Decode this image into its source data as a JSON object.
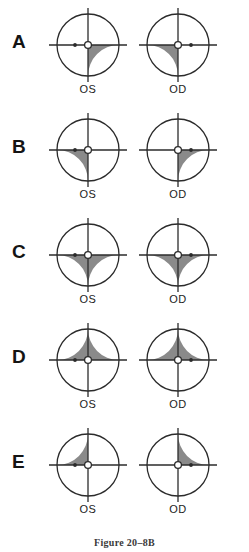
{
  "figure": {
    "caption": "Figure 20–8B",
    "colors": {
      "shaded": "#8a8a8a",
      "outline": "#2b2b2b",
      "background": "#ffffff",
      "label": "#141414"
    },
    "eye_labels": {
      "left": "OS",
      "right": "OD"
    },
    "rows": [
      {
        "label": "A",
        "os": {
          "eye_label": "OS",
          "shaded": [
            "lower-right"
          ],
          "blind_spot": "left"
        },
        "od": {
          "eye_label": "OD",
          "shaded": [
            "lower-left"
          ],
          "blind_spot": "right"
        }
      },
      {
        "label": "B",
        "os": {
          "eye_label": "OS",
          "shaded": [
            "lower-left"
          ],
          "blind_spot": "left"
        },
        "od": {
          "eye_label": "OD",
          "shaded": [
            "lower-right"
          ],
          "blind_spot": "right"
        }
      },
      {
        "label": "C",
        "os": {
          "eye_label": "OS",
          "shaded": [
            "lower-left",
            "lower-right"
          ],
          "blind_spot": "left"
        },
        "od": {
          "eye_label": "OD",
          "shaded": [
            "lower-left",
            "lower-right"
          ],
          "blind_spot": "right"
        }
      },
      {
        "label": "D",
        "os": {
          "eye_label": "OS",
          "shaded": [
            "upper-left",
            "upper-right"
          ],
          "blind_spot": "left"
        },
        "od": {
          "eye_label": "OD",
          "shaded": [
            "upper-left",
            "upper-right"
          ],
          "blind_spot": "right"
        }
      },
      {
        "label": "E",
        "os": {
          "eye_label": "OS",
          "shaded": [
            "upper-left"
          ],
          "blind_spot": "left"
        },
        "od": {
          "eye_label": "OD",
          "shaded": [
            "upper-right"
          ],
          "blind_spot": "right"
        }
      }
    ]
  }
}
